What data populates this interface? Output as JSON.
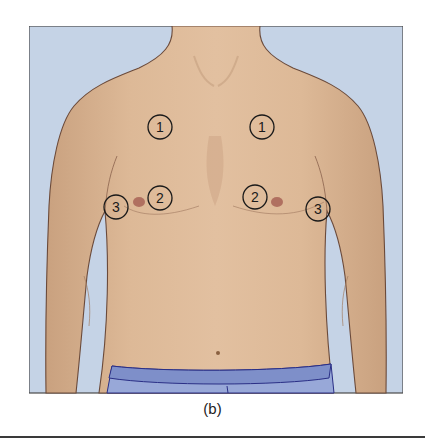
{
  "figure": {
    "caption": "(b)",
    "colors": {
      "background": "#c5d3e6",
      "skin": "#dcb896",
      "skin_shadow": "#c89e7c",
      "outline": "#6b4a3a",
      "waistband": "#7e8fc9",
      "shorts": "#98a8d8",
      "shorts_outline": "#2a2f86",
      "nipple": "#b07060",
      "label_stroke": "#1a1a1a"
    },
    "markers": [
      {
        "label": "1",
        "side": "right",
        "cx": 131,
        "cy": 101
      },
      {
        "label": "1",
        "side": "left",
        "cx": 233,
        "cy": 101
      },
      {
        "label": "2",
        "side": "right",
        "cx": 131,
        "cy": 172
      },
      {
        "label": "2",
        "side": "left",
        "cx": 226,
        "cy": 171
      },
      {
        "label": "3",
        "side": "right",
        "cx": 87,
        "cy": 181
      },
      {
        "label": "3",
        "side": "left",
        "cx": 289,
        "cy": 183
      }
    ]
  }
}
